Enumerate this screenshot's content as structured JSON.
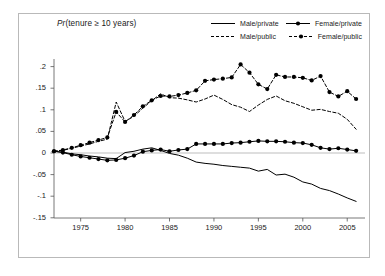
{
  "chart_data": {
    "type": "line",
    "title": "Pr(tenure ≥ 10 years)",
    "title_prefix_italic": "Pr",
    "title_rest": "(tenure ≥ 10 years)",
    "xlabel": "",
    "ylabel": "",
    "xlim": [
      1972,
      2007
    ],
    "ylim": [
      -0.165,
      0.225
    ],
    "grid": false,
    "zero_line": true,
    "legend_position": "top-right",
    "x_ticks": [
      1975,
      1980,
      1985,
      1990,
      1995,
      2000,
      2005
    ],
    "x_tick_labels": [
      "1975",
      "1980",
      "1985",
      "1990",
      "1995",
      "2000",
      "2005"
    ],
    "y_ticks": [
      0.2,
      0.15,
      0.1,
      0.05,
      0,
      -0.05,
      -0.1,
      -0.15
    ],
    "y_tick_labels": [
      ".2",
      ".15",
      ".1",
      ".05",
      "0",
      "-.05",
      "-.1",
      "-.15"
    ],
    "x": [
      1972,
      1973,
      1974,
      1975,
      1976,
      1977,
      1978,
      1979,
      1980,
      1981,
      1982,
      1983,
      1984,
      1985,
      1986,
      1987,
      1988,
      1989,
      1990,
      1991,
      1992,
      1993,
      1994,
      1995,
      1996,
      1997,
      1998,
      1999,
      2000,
      2001,
      2002,
      2003,
      2004,
      2005,
      2006
    ],
    "series": [
      {
        "name": "Male/private",
        "key": "male_private",
        "style": "solid",
        "marker": "none",
        "color": "#000000",
        "values": [
          0.004,
          0.002,
          -0.002,
          -0.004,
          -0.007,
          -0.009,
          -0.012,
          -0.013,
          0.001,
          0.004,
          0.009,
          0.012,
          0.006,
          -0.001,
          -0.005,
          -0.012,
          -0.021,
          -0.024,
          -0.026,
          -0.029,
          -0.031,
          -0.033,
          -0.035,
          -0.042,
          -0.038,
          -0.051,
          -0.049,
          -0.056,
          -0.067,
          -0.072,
          -0.082,
          -0.087,
          -0.095,
          -0.104,
          -0.112
        ]
      },
      {
        "name": "Female/private",
        "key": "female_private",
        "style": "solid",
        "marker": "circle",
        "color": "#000000",
        "values": [
          0.004,
          0.001,
          -0.004,
          -0.008,
          -0.011,
          -0.014,
          -0.017,
          -0.016,
          -0.012,
          -0.006,
          0.003,
          0.006,
          0.008,
          0.004,
          0.007,
          0.009,
          0.021,
          0.021,
          0.021,
          0.021,
          0.023,
          0.024,
          0.026,
          0.028,
          0.027,
          0.027,
          0.026,
          0.024,
          0.023,
          0.019,
          0.012,
          0.009,
          0.011,
          0.008,
          0.005
        ]
      },
      {
        "name": "Male/public",
        "key": "male_public",
        "style": "dashed",
        "marker": "none",
        "color": "#000000",
        "values": [
          0.004,
          0.006,
          0.011,
          0.016,
          0.021,
          0.027,
          0.032,
          0.118,
          0.073,
          0.085,
          0.104,
          0.121,
          0.137,
          0.128,
          0.127,
          0.123,
          0.118,
          0.125,
          0.134,
          0.124,
          0.112,
          0.106,
          0.096,
          0.111,
          0.124,
          0.132,
          0.121,
          0.115,
          0.107,
          0.099,
          0.101,
          0.096,
          0.092,
          0.078,
          0.055
        ]
      },
      {
        "name": "Female/public",
        "key": "female_public",
        "style": "dashed",
        "marker": "circle",
        "color": "#000000",
        "values": [
          0.004,
          0.007,
          0.012,
          0.018,
          0.024,
          0.03,
          0.036,
          0.095,
          0.072,
          0.088,
          0.108,
          0.122,
          0.132,
          0.131,
          0.134,
          0.139,
          0.145,
          0.167,
          0.17,
          0.172,
          0.175,
          0.205,
          0.186,
          0.159,
          0.148,
          0.181,
          0.176,
          0.176,
          0.174,
          0.168,
          0.178,
          0.141,
          0.131,
          0.143,
          0.125
        ]
      }
    ]
  },
  "legend": {
    "entries": [
      {
        "label": "Male/private",
        "style": "solid",
        "marker": "none"
      },
      {
        "label": "Female/private",
        "style": "solid",
        "marker": "circle"
      },
      {
        "label": "Male/public",
        "style": "dashed",
        "marker": "none"
      },
      {
        "label": "Female/public",
        "style": "dashed",
        "marker": "circle"
      }
    ]
  }
}
